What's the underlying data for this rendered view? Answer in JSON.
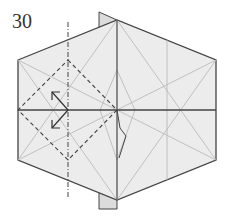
{
  "diagram": {
    "step_number": "30",
    "colors": {
      "paper": "#ececec",
      "edge": "#444444",
      "crease": "#b0b0b0",
      "fold_line": "#444444"
    },
    "elements": [
      {
        "type": "hexagon-model",
        "description": "Hexagonal folded base with light gray paper"
      },
      {
        "type": "valley-fold-square",
        "description": "Dashed diamond-shaped valley fold lines on left half"
      },
      {
        "type": "mountain-fold-line",
        "description": "Vertical dash-dot line through left diamond"
      },
      {
        "type": "arrows",
        "description": "Two fold arrows pointing up-left and down-left"
      },
      {
        "type": "center-flap",
        "description": "Vertical flap at center with small squash detail"
      }
    ]
  }
}
